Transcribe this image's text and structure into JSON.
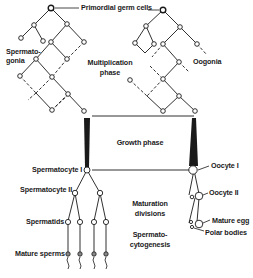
{
  "diagram": {
    "labels": {
      "primordial_germ_cells": "Primordial germ cells",
      "spermatogonia_1": "Spermato-",
      "spermatogonia_2": "gonia",
      "multiplication_1": "Multiplication",
      "multiplication_2": "phase",
      "oogonia": "Oogonia",
      "growth_phase": "Growth phase",
      "spermatocyte_1": "Spermatocyte I",
      "oocyte_1": "Oocyte I",
      "spermatocyte_2": "Spermatocyte II",
      "oocyte_2": "Oocyte II",
      "maturation_1": "Maturation",
      "maturation_2": "divisions",
      "spermatids": "Spermatids",
      "mature_egg": "Mature egg",
      "spermatocytogenesis_1": "Spermato-",
      "spermatocytogenesis_2": "cytogenesis",
      "polar_bodies": "Polar bodies",
      "mature_sperms": "Mature sperms"
    },
    "colors": {
      "line": "#1a1a1a",
      "cell_fill": "#ffffff",
      "background": "#ffffff"
    }
  }
}
